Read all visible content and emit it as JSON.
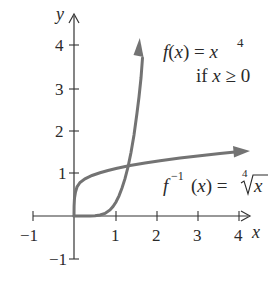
{
  "diagram": {
    "axes": {
      "x_label": "x",
      "y_label": "y",
      "x_ticks": [
        "−1",
        "1",
        "2",
        "3",
        "4"
      ],
      "y_ticks": [
        "4",
        "3",
        "2",
        "1",
        "−1"
      ]
    },
    "curves": [
      {
        "name": "f",
        "label_lhs": "f(x) = x",
        "exponent": "4",
        "condition": "if x ≥ 0",
        "color": "#737373"
      },
      {
        "name": "f_inverse",
        "label_f": "f",
        "label_sup": "−1",
        "label_mid": "(x) = ",
        "root_index": "4",
        "radicand": "x",
        "color": "#737373"
      }
    ],
    "colors": {
      "axis": "#333333",
      "curve": "#737373",
      "text": "#2a2a2a"
    }
  }
}
